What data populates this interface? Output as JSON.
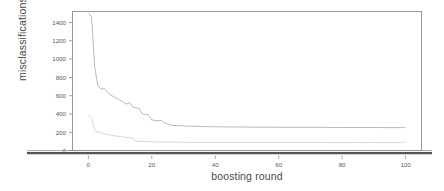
{
  "chart_data": {
    "type": "line",
    "title": "",
    "xlabel": "boosting round",
    "ylabel": "misclassifications",
    "xlim": [
      -5,
      105
    ],
    "ylim": [
      0,
      1500
    ],
    "grid": false,
    "legend": "none",
    "xticks": [
      0,
      20,
      40,
      60,
      80,
      100
    ],
    "yticks": [
      0,
      200,
      400,
      600,
      800,
      1000,
      1200,
      1400
    ],
    "xtick_labels": [
      "0",
      "20",
      "40",
      "60",
      "80",
      "100"
    ],
    "ytick_labels": [
      "0",
      "200",
      "400",
      "600",
      "800",
      "1000",
      "1200",
      "1400"
    ],
    "series": [
      {
        "name": "train misclassifications",
        "color": "#b9b9b9",
        "x": [
          0,
          1,
          2,
          3,
          4,
          5,
          6,
          7,
          8,
          9,
          10,
          11,
          12,
          13,
          14,
          15,
          16,
          17,
          18,
          19,
          20,
          21,
          22,
          23,
          24,
          25,
          26,
          27,
          28,
          30,
          32,
          34,
          36,
          38,
          40,
          45,
          50,
          55,
          60,
          65,
          70,
          75,
          80,
          85,
          90,
          95,
          99,
          100
        ],
        "values": [
          1480,
          1445,
          900,
          700,
          660,
          670,
          630,
          600,
          580,
          560,
          545,
          520,
          500,
          520,
          470,
          460,
          455,
          395,
          390,
          385,
          330,
          325,
          320,
          325,
          300,
          285,
          275,
          270,
          268,
          265,
          262,
          260,
          258,
          257,
          256,
          254,
          253,
          252,
          251,
          250,
          250,
          249,
          249,
          248,
          248,
          247,
          247,
          252
        ]
      },
      {
        "name": "test misclassifications",
        "color": "#d8d8d8",
        "x": [
          0,
          1,
          2,
          3,
          4,
          5,
          6,
          7,
          8,
          9,
          10,
          11,
          12,
          13,
          14,
          15,
          16,
          17,
          18,
          20,
          22,
          24,
          26,
          28,
          30,
          35,
          40,
          45,
          50,
          55,
          60,
          65,
          70,
          75,
          80,
          85,
          90,
          95,
          99,
          100
        ],
        "values": [
          380,
          355,
          215,
          200,
          190,
          180,
          172,
          165,
          160,
          155,
          150,
          145,
          142,
          138,
          135,
          100,
          98,
          97,
          96,
          94,
          93,
          92,
          91,
          90,
          89,
          88,
          88,
          87,
          87,
          86,
          86,
          86,
          86,
          85,
          85,
          85,
          85,
          85,
          85,
          100
        ]
      }
    ],
    "axis_baseline": {
      "name": "zero-baseline",
      "color": "#555555",
      "value": 0
    }
  },
  "figure": {
    "background": "#ffffff",
    "frame_color": "#9a9a9a",
    "tick_color": "#9a9a9a",
    "text_color": "#4a4a4a"
  }
}
